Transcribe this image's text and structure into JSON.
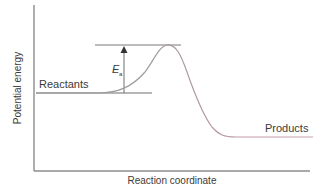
{
  "diagram": {
    "y_axis_label": "Potential energy",
    "x_axis_label": "Reaction coordinate",
    "reactants_label": "Reactants",
    "products_label": "Products",
    "activation_energy_label": "E",
    "activation_energy_subscript": "a",
    "colors": {
      "axis": "#8c8c8c",
      "level_lines": "#7a7a7a",
      "curve_rising": "#9a9a9a",
      "curve_falling": "#c89aa6",
      "text": "#3a3a3a"
    }
  }
}
